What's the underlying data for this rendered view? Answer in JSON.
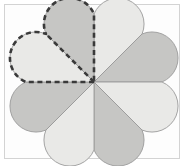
{
  "figure": {
    "frame": {
      "border_color": "#d3d3d3",
      "background_color": "#fdfdfd"
    },
    "canvas": {
      "width": 186,
      "height": 166,
      "background_color": "#ffffff"
    }
  },
  "flower": {
    "center_x": 94,
    "center_y": 82,
    "radius": 68,
    "petal_count": 8,
    "petal_outline_color": "#9a9a9a",
    "colors": {
      "light_petal": "#e9e9e7",
      "dark_petal": "#c6c6c4",
      "highlight_stroke": "#3a3a3a"
    },
    "petals": [
      {
        "index": 0,
        "label": "petal-upper-right",
        "start_angle": -90,
        "end_angle": -45,
        "shade": "light",
        "fill": "#e9e9e7",
        "highlighted": false
      },
      {
        "index": 1,
        "label": "petal-right-upper",
        "start_angle": -45,
        "end_angle": 0,
        "shade": "dark",
        "fill": "#c6c6c4",
        "highlighted": false
      },
      {
        "index": 2,
        "label": "petal-right-lower",
        "start_angle": 0,
        "end_angle": 45,
        "shade": "light",
        "fill": "#e9e9e7",
        "highlighted": false
      },
      {
        "index": 3,
        "label": "petal-lower-right",
        "start_angle": 45,
        "end_angle": 90,
        "shade": "dark",
        "fill": "#c6c6c4",
        "highlighted": false
      },
      {
        "index": 4,
        "label": "petal-lower-left",
        "start_angle": 90,
        "end_angle": 135,
        "shade": "light",
        "fill": "#e9e9e7",
        "highlighted": false
      },
      {
        "index": 5,
        "label": "petal-left-lower",
        "start_angle": 135,
        "end_angle": 180,
        "shade": "dark",
        "fill": "#c6c6c4",
        "highlighted": false
      },
      {
        "index": 6,
        "label": "petal-left-upper",
        "start_angle": 180,
        "end_angle": 225,
        "shade": "light",
        "fill": "#e9e9e7",
        "highlighted": true
      },
      {
        "index": 7,
        "label": "petal-upper-left",
        "start_angle": 225,
        "end_angle": 270,
        "shade": "dark",
        "fill": "#c6c6c4",
        "highlighted": true
      }
    ]
  },
  "highlight": {
    "name": "dashed-selection-outline",
    "description": "Dashed outline enclosing the two upper-left petals",
    "petals_enclosed": 2,
    "fraction_of_whole": "2/8",
    "stroke_color": "#3a3a3a",
    "stroke_width": 2.6,
    "dash_pattern": "5 3.6"
  }
}
